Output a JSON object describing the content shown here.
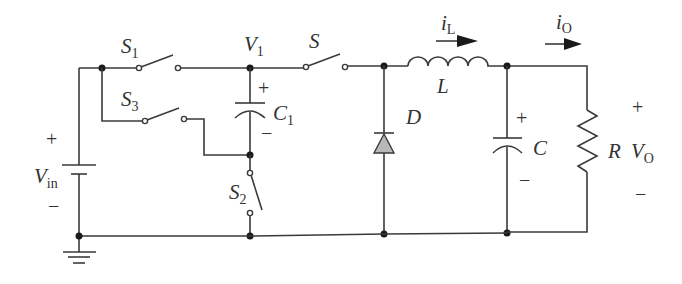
{
  "diagram": {
    "type": "circuit-schematic",
    "colors": {
      "wire": "#3a3a3a",
      "diode_fill": "#b8b8b8",
      "background": "#ffffff"
    },
    "labels": {
      "S1": {
        "main": "S",
        "sub": "1"
      },
      "S3": {
        "main": "S",
        "sub": "3"
      },
      "S2": {
        "main": "S",
        "sub": "2"
      },
      "S": {
        "main": "S"
      },
      "V1": {
        "main": "V",
        "sub": "1"
      },
      "C1": {
        "main": "C",
        "sub": "1"
      },
      "Vin": {
        "main": "V",
        "sub": "in"
      },
      "D": {
        "main": "D"
      },
      "L": {
        "main": "L"
      },
      "iL": {
        "main": "i",
        "sub": "L"
      },
      "iO": {
        "main": "i",
        "sub": "O"
      },
      "C": {
        "main": "C"
      },
      "R": {
        "main": "R"
      },
      "VO": {
        "main": "V",
        "sub": "O"
      }
    },
    "signs": {
      "plus": "+",
      "minus": "−"
    },
    "components": [
      {
        "id": "Vin",
        "type": "dc-source"
      },
      {
        "id": "S1",
        "type": "switch"
      },
      {
        "id": "S3",
        "type": "switch"
      },
      {
        "id": "S2",
        "type": "switch"
      },
      {
        "id": "C1",
        "type": "capacitor"
      },
      {
        "id": "S",
        "type": "switch"
      },
      {
        "id": "D",
        "type": "diode"
      },
      {
        "id": "L",
        "type": "inductor"
      },
      {
        "id": "C",
        "type": "capacitor"
      },
      {
        "id": "R",
        "type": "resistor"
      },
      {
        "id": "GND",
        "type": "ground"
      }
    ]
  }
}
